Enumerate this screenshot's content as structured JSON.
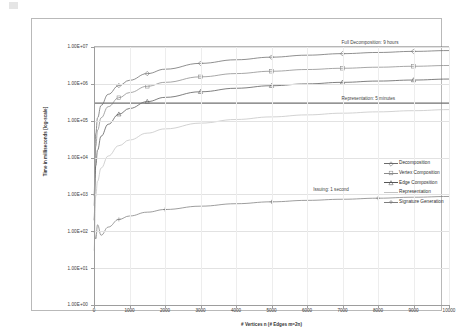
{
  "chart_data": {
    "type": "line",
    "title": "",
    "xlabel": "# Vertices n (# Edges m=2n)",
    "ylabel": "Time in milliseconds  [log-scale]",
    "yscale": "log",
    "ylim": [
      1,
      10000000
    ],
    "xlim": [
      0,
      10000
    ],
    "grid": true,
    "legend_position": "right",
    "y_ticks": [
      "1.00E+00",
      "1.00E+01",
      "1.00E+02",
      "1.00E+03",
      "1.00E+04",
      "1.00E+05",
      "1.00E+06",
      "1.00E+07"
    ],
    "y_tick_values": [
      1,
      10,
      100,
      1000,
      10000,
      100000,
      1000000,
      10000000
    ],
    "x_ticks": [
      "0",
      "1000",
      "2000",
      "3000",
      "4000",
      "5000",
      "6000",
      "7000",
      "8000",
      "9000",
      "10000"
    ],
    "x_tick_values": [
      0,
      1000,
      2000,
      3000,
      4000,
      5000,
      6000,
      7000,
      8000,
      9000,
      10000
    ],
    "x": [
      0,
      50,
      100,
      200,
      400,
      700,
      1000,
      1500,
      2000,
      3000,
      4000,
      5000,
      6000,
      7000,
      8000,
      9000,
      10000
    ],
    "series": [
      {
        "name": "Decomposition",
        "color": "#6b6b6b",
        "marker": "diamond",
        "values": [
          900,
          45000,
          120000,
          260000,
          520000,
          900000,
          1250000,
          1900000,
          2500000,
          3600000,
          4500000,
          5300000,
          6000000,
          6600000,
          7100000,
          7600000,
          8000000
        ]
      },
      {
        "name": "Vertex Composition",
        "color": "#8a8a8a",
        "marker": "square",
        "values": [
          500,
          20000,
          55000,
          120000,
          240000,
          420000,
          580000,
          860000,
          1100000,
          1550000,
          1900000,
          2200000,
          2450000,
          2650000,
          2830000,
          3000000,
          3150000
        ]
      },
      {
        "name": "Edge Composition",
        "color": "#565656",
        "marker": "triangle",
        "values": [
          200,
          6000,
          16000,
          38000,
          80000,
          150000,
          215000,
          330000,
          430000,
          610000,
          760000,
          890000,
          1000000,
          1100000,
          1190000,
          1270000,
          1350000
        ]
      },
      {
        "name": "Representation",
        "color": "#c3c3c3",
        "marker": "none",
        "values": [
          30,
          900,
          2300,
          5200,
          11000,
          21000,
          30000,
          46000,
          60000,
          86000,
          108000,
          127000,
          144000,
          160000,
          174000,
          187000,
          200000
        ]
      },
      {
        "name": "Signature Generation",
        "color": "#7d7d7d",
        "marker": "plus",
        "values": [
          95,
          62,
          150,
          78,
          130,
          210,
          260,
          330,
          390,
          480,
          560,
          630,
          690,
          740,
          790,
          840,
          880
        ]
      }
    ],
    "reference_lines": [
      {
        "label": "Full Decomposition: 9 hours",
        "value": 10000000,
        "label_x": 8100
      },
      {
        "label": "Representation: 5 minutes",
        "value": 300000,
        "label_x": 8100
      },
      {
        "label": "Issuing: 1 second",
        "value": 1000,
        "label_x": 7300
      }
    ]
  }
}
